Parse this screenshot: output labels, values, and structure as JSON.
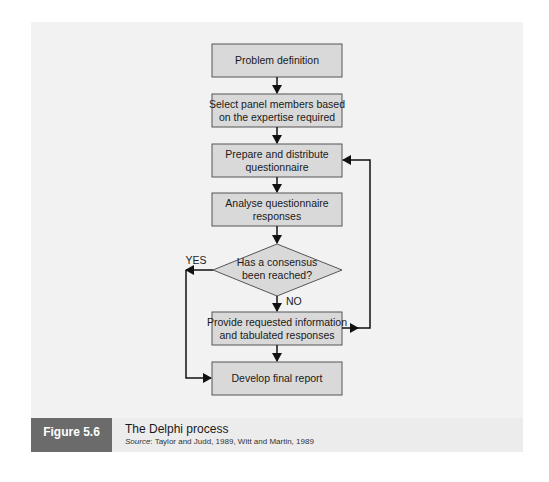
{
  "diagram": {
    "title": "The Delphi process",
    "nodes": [
      {
        "id": "n1",
        "type": "process",
        "lines": [
          "Problem definition"
        ]
      },
      {
        "id": "n2",
        "type": "process",
        "lines": [
          "Select panel members based",
          "on the expertise required"
        ]
      },
      {
        "id": "n3",
        "type": "process",
        "lines": [
          "Prepare and distribute",
          "questionnaire"
        ]
      },
      {
        "id": "n4",
        "type": "process",
        "lines": [
          "Analyse questionnaire",
          "responses"
        ]
      },
      {
        "id": "n5",
        "type": "decision",
        "lines": [
          "Has a consensus",
          "been reached?"
        ]
      },
      {
        "id": "n6",
        "type": "process",
        "lines": [
          "Provide requested information",
          "and tabulated responses"
        ]
      },
      {
        "id": "n7",
        "type": "process",
        "lines": [
          "Develop final report"
        ]
      }
    ],
    "edges": [
      {
        "from": "n1",
        "to": "n2",
        "label": ""
      },
      {
        "from": "n2",
        "to": "n3",
        "label": ""
      },
      {
        "from": "n3",
        "to": "n4",
        "label": ""
      },
      {
        "from": "n4",
        "to": "n5",
        "label": ""
      },
      {
        "from": "n5",
        "to": "n6",
        "label": "NO"
      },
      {
        "from": "n5",
        "to": "n7",
        "label": "YES"
      },
      {
        "from": "n6",
        "to": "n7",
        "label": ""
      },
      {
        "from": "n6",
        "to": "n3",
        "label": ""
      }
    ],
    "labels": {
      "yes": "YES",
      "no": "NO"
    },
    "colors": {
      "panel": "#f2f2f2",
      "box_fill": "#d9d9d9",
      "box_stroke": "#555555",
      "line": "#111111",
      "label_box": "#6b6b6b"
    }
  },
  "caption": {
    "figure_label": "Figure 5.6",
    "title": "The Delphi process",
    "source_prefix": "Source",
    "source_text": ": Taylor and Judd, 1989, Witt and Martin, 1989"
  }
}
